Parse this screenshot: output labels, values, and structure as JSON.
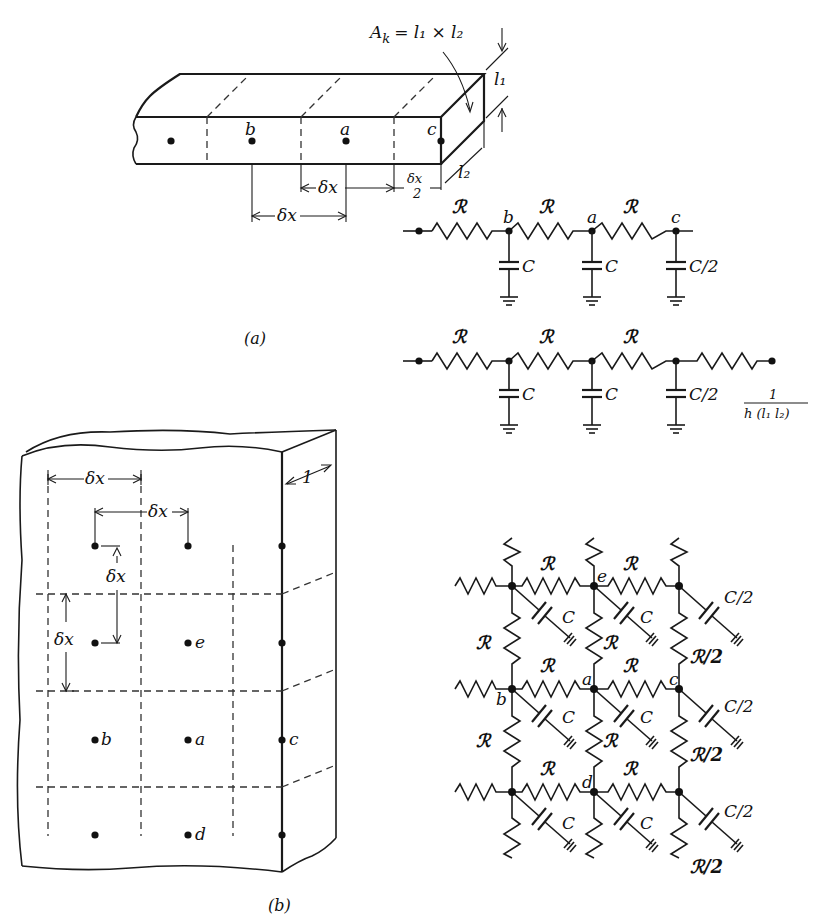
{
  "figure": {
    "caption_a": "(a)",
    "caption_b": "(b)",
    "colors": {
      "ink": "#111111",
      "background": "#ffffff"
    }
  },
  "part_a": {
    "area_formula": "A_k = l₁ × l₂",
    "area_label_lhs": "A",
    "area_label_sub": "k",
    "area_label_rhs": "= l₁ × l₂",
    "dim_l1": "l₁",
    "dim_l2": "l₂",
    "nodes": {
      "b": "b",
      "a": "a",
      "c": "c"
    },
    "dim_dx_upper": "δx",
    "dim_dx_lower": "δx",
    "dim_half_num": "δx",
    "dim_half_den": "2"
  },
  "circuit_a1": {
    "resistors": [
      "ℛ",
      "ℛ",
      "ℛ"
    ],
    "nodes": [
      "b",
      "a",
      "c"
    ],
    "capacitors": [
      "C",
      "C",
      "C/2"
    ]
  },
  "circuit_a2": {
    "resistors": [
      "ℛ",
      "ℛ",
      "ℛ"
    ],
    "capacitors": [
      "C",
      "C",
      "C/2"
    ],
    "boundary_resistor_num": "1",
    "boundary_resistor_den": "h (l₁ l₂)"
  },
  "part_b": {
    "depth_label": "1",
    "dims": [
      "δx",
      "δx",
      "δx",
      "δx"
    ],
    "nodes": {
      "e": "e",
      "b": "b",
      "a": "a",
      "c": "c",
      "d": "d"
    }
  },
  "network_b": {
    "resistor_label": "ℛ",
    "half_resistor_label": "ℛ/2",
    "capacitor_label": "C",
    "half_capacitor_label": "C/2",
    "nodes": {
      "e": "e",
      "b": "b",
      "a": "a",
      "c": "c",
      "d": "d"
    }
  }
}
